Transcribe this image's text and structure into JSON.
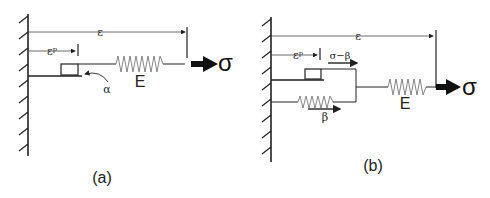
{
  "panels": [
    {
      "id": "a",
      "caption": "(a)",
      "labels": {
        "total_strain": "ε",
        "plastic_strain": "εᵖ",
        "friction": "α",
        "modulus": "E",
        "stress": "σ"
      }
    },
    {
      "id": "b",
      "caption": "(b)",
      "labels": {
        "total_strain": "ε",
        "plastic_strain": "εᵖ",
        "slider_force": "σ−β",
        "back_stress": "β",
        "modulus": "E",
        "stress": "σ"
      }
    }
  ],
  "colors": {
    "line": "#222222",
    "spring": "#777777",
    "background": "#ffffff"
  }
}
